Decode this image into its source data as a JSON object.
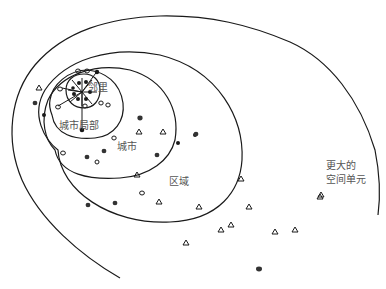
{
  "diagram": {
    "labels": {
      "neighborhood": "邻里",
      "city_local": "城市局部",
      "city": "城市",
      "region": "区域",
      "larger_unit_line1": "更大的",
      "larger_unit_line2": "空间单元"
    },
    "rings": [
      "邻里",
      "城市局部",
      "城市",
      "区域",
      "更大的空间单元"
    ],
    "colors": {
      "stroke": "#1a1a1a",
      "label": "#555555",
      "background": "#ffffff"
    }
  }
}
